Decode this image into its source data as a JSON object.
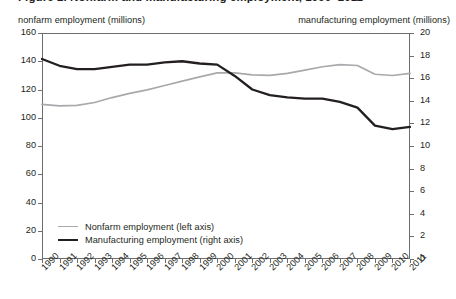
{
  "title_remnant": "Figure 2. Nonfarm and manufacturing employment, 1990–2011",
  "captions": {
    "left_axis": "nonfarm employment (millions)",
    "right_axis": "manufacturing employment (millions)"
  },
  "legend": {
    "items": [
      {
        "label": "Nonfarm employment (left axis)",
        "color": "#a7a9ac",
        "series": "nonfarm"
      },
      {
        "label": "Manufacturing employment (right axis)",
        "color": "#231f20",
        "series": "manufacturing"
      }
    ]
  },
  "colors": {
    "nonfarm": "#a7a9ac",
    "manufacturing": "#231f20",
    "axis": "#6d6e71",
    "text": "#231f20",
    "background": "#ffffff"
  },
  "chart_data": {
    "type": "line",
    "title": "Nonfarm and manufacturing employment",
    "xlabel": "",
    "ylabel": "nonfarm employment (millions)",
    "y2label": "manufacturing employment (millions)",
    "grid": false,
    "legend_position": "bottom-left",
    "x": [
      1990,
      1991,
      1992,
      1993,
      1994,
      1995,
      1996,
      1997,
      1998,
      1999,
      2000,
      2001,
      2002,
      2003,
      2004,
      2005,
      2006,
      2007,
      2008,
      2009,
      2010,
      2011
    ],
    "categories": [
      "1990",
      "1991",
      "1992",
      "1993",
      "1994",
      "1995",
      "1996",
      "1997",
      "1998",
      "1999",
      "2000",
      "2001",
      "2002",
      "2003",
      "2004",
      "2005",
      "2006",
      "2007",
      "2008",
      "2009",
      "2010",
      "2011"
    ],
    "ylim": [
      0,
      160
    ],
    "yticks": [
      0,
      20,
      40,
      60,
      80,
      100,
      120,
      140,
      160
    ],
    "y2lim": [
      0,
      20
    ],
    "y2ticks": [
      0,
      2,
      4,
      6,
      8,
      10,
      12,
      14,
      16,
      18,
      20
    ],
    "series": [
      {
        "name": "Nonfarm employment (left axis)",
        "axis": "left",
        "color": "#a7a9ac",
        "values": [
          109.5,
          108.4,
          108.7,
          110.8,
          114.3,
          117.3,
          119.7,
          122.8,
          125.9,
          128.9,
          131.8,
          131.8,
          130.3,
          130.0,
          131.4,
          133.7,
          136.1,
          137.6,
          137.0,
          130.8,
          129.9,
          131.4
        ]
      },
      {
        "name": "Manufacturing employment (right axis)",
        "axis": "right",
        "color": "#231f20",
        "values": [
          17.7,
          17.1,
          16.8,
          16.8,
          17.0,
          17.2,
          17.2,
          17.4,
          17.5,
          17.3,
          17.2,
          16.2,
          15.0,
          14.5,
          14.3,
          14.2,
          14.2,
          13.9,
          13.4,
          11.8,
          11.5,
          11.7
        ]
      }
    ]
  }
}
